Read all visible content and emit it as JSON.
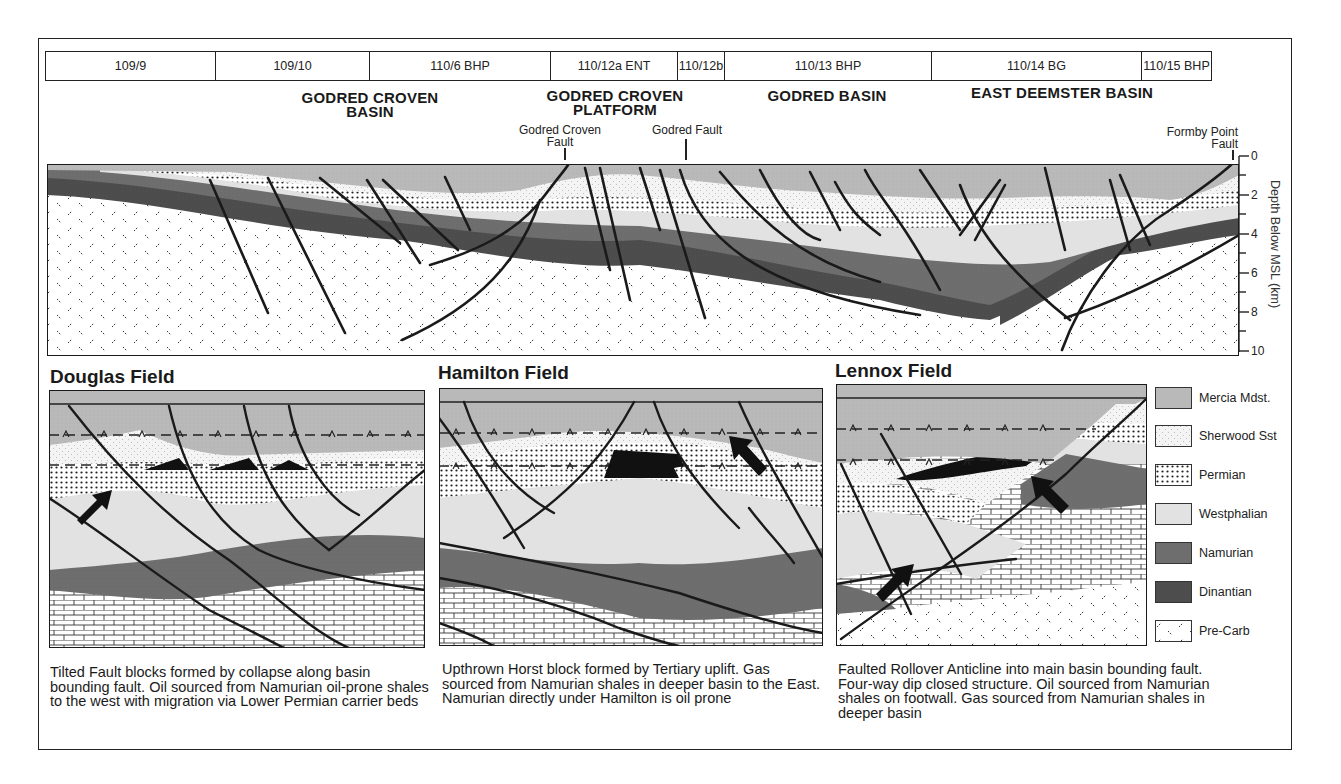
{
  "header": {
    "licence_blocks": [
      {
        "label": "109/9",
        "width": 170
      },
      {
        "label": "109/10",
        "width": 154
      },
      {
        "label": "110/6 BHP",
        "width": 181
      },
      {
        "label": "110/12a ENT",
        "width": 127
      },
      {
        "label": "110/12b",
        "width": 47
      },
      {
        "label": "110/13 BHP",
        "width": 207
      },
      {
        "label": "110/14 BG",
        "width": 210
      },
      {
        "label": "110/15 BHP",
        "width": 69
      }
    ]
  },
  "regions": {
    "godred_croven_basin": "GODRED CROVEN\nBASIN",
    "godred_croven_platform": "GODRED CROVEN\nPLATFORM",
    "godred_basin": "GODRED BASIN",
    "east_deemster_basin": "EAST DEEMSTER BASIN"
  },
  "faults": {
    "godred_croven_fault": "Godred Croven\nFault",
    "godred_fault": "Godred Fault",
    "formby_point_fault": "Formby Point\nFault"
  },
  "depth_axis": {
    "label": "Depth Below MSL (km)",
    "ticks": [
      "0",
      "2",
      "4",
      "6",
      "8",
      "10"
    ],
    "range": [
      0,
      10
    ]
  },
  "panels": [
    {
      "title": "Douglas Field",
      "caption": "Tilted Fault blocks formed by collapse along basin bounding fault. Oil sourced from Namurian oil-prone shales to the west with migration via Lower Permian carrier beds"
    },
    {
      "title": "Hamilton Field",
      "caption": "Upthrown Horst block formed by Tertiary uplift. Gas sourced from Namurian shales in deeper basin to the East. Namurian directly under Hamilton is oil prone"
    },
    {
      "title": "Lennox Field",
      "caption": "Faulted Rollover Anticline into main basin bounding fault. Four-way dip closed structure. Oil sourced from Namurian shales on footwall. Gas sourced from Namurian shales in deeper basin"
    }
  ],
  "legend": {
    "items": [
      {
        "label": "Mercia Mdst.",
        "pattern": "mercia",
        "color": "#b9b9b9"
      },
      {
        "label": "Sherwood Sst",
        "pattern": "sherwood",
        "color": "#f4f4f4"
      },
      {
        "label": "Permian",
        "pattern": "permian",
        "color": "#ffffff"
      },
      {
        "label": "Westphalian",
        "pattern": "westphalian",
        "color": "#e2e2e2"
      },
      {
        "label": "Namurian",
        "pattern": "namurian",
        "color": "#6e6e6e"
      },
      {
        "label": "Dinantian",
        "pattern": "dinantian",
        "color": "#4d4d4d"
      },
      {
        "label": "Pre-Carb",
        "pattern": "precarb",
        "color": "#ffffff"
      }
    ]
  },
  "colors": {
    "mercia": "#b9b9b9",
    "sherwood": "#f4f4f4",
    "westphalian": "#e2e2e2",
    "namurian": "#6e6e6e",
    "dinantian": "#4d4d4d",
    "hydrocarbon": "#111111",
    "line": "#1a1a1a"
  }
}
